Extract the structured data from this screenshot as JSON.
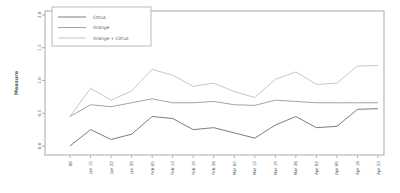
{
  "figure": {
    "background": "#ffffff",
    "axis_color": "#9f9f9f",
    "tick_label_color": "#5a5a5a",
    "ylabel": "Measure",
    "ylabel_color": "#3a3a3a"
  },
  "legend": {
    "border_color": "#ababab",
    "entries": [
      {
        "label": "Citrus",
        "color": "#6e6e6e"
      },
      {
        "label": "Orange",
        "color": "#989898"
      },
      {
        "label": "Orange + Citrus",
        "color": "#c0c0c0"
      }
    ]
  },
  "chart_data": {
    "type": "line",
    "title": "",
    "xlabel": "",
    "ylabel": "Measure",
    "x": [
      "08",
      "Jan 15",
      "Jan 22",
      "Jan 29",
      "Feb 05",
      "Feb 12",
      "Feb 19",
      "Feb 26",
      "Mar 05",
      "Mar 12",
      "Mar 19",
      "Mar 26",
      "Apr 02",
      "Apr 09",
      "Apr 16",
      "Apr 23"
    ],
    "series": [
      {
        "name": "Citrus",
        "color": "#6e6e6e",
        "values": [
          0.0,
          0.25,
          0.1,
          0.18,
          0.45,
          0.42,
          0.25,
          0.28,
          0.2,
          0.12,
          0.32,
          0.45,
          0.28,
          0.3,
          0.56,
          0.57
        ]
      },
      {
        "name": "Orange",
        "color": "#989898",
        "values": [
          0.45,
          0.63,
          0.6,
          0.66,
          0.72,
          0.66,
          0.66,
          0.68,
          0.63,
          0.62,
          0.7,
          0.68,
          0.66,
          0.66,
          0.66,
          0.66
        ]
      },
      {
        "name": "Orange + Citrus",
        "color": "#c0c0c0",
        "values": [
          0.45,
          0.88,
          0.7,
          0.84,
          1.17,
          1.08,
          0.91,
          0.96,
          0.83,
          0.74,
          1.02,
          1.13,
          0.94,
          0.96,
          1.22,
          1.23
        ]
      }
    ],
    "ylim": [
      0.0,
      2.0
    ],
    "yticks": [
      0.0,
      0.5,
      1.0,
      1.5,
      2.0
    ],
    "ytick_labels": [
      "0.0",
      "0.5",
      "1.0",
      "1.5",
      "2.0"
    ],
    "grid": false,
    "legend_position": "top-left",
    "frame": "full-box"
  }
}
